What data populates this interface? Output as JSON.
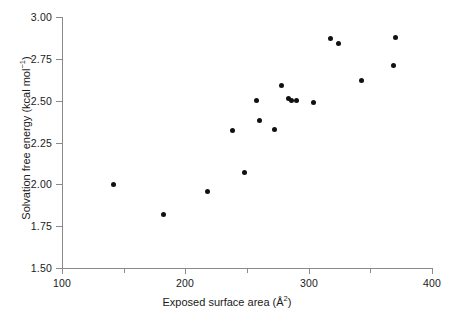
{
  "chart_data": {
    "type": "scatter",
    "title": "",
    "xlabel": "Exposed surface area (Å2)",
    "xlabel_base": "Exposed surface area (Å",
    "xlabel_sup": "2",
    "xlabel_tail": ")",
    "ylabel": "Solvation free energy (kcal mol-1)",
    "ylabel_base": "Solvation free energy (kcal mol",
    "ylabel_sup": "−1",
    "ylabel_tail": ")",
    "xlim": [
      100,
      400
    ],
    "ylim": [
      1.5,
      3.0
    ],
    "grid": false,
    "legend": null,
    "marker": "filled-circle",
    "marker_color": "#111111",
    "axis_color": "#8a8a8a",
    "xticks": [
      100,
      200,
      300,
      400
    ],
    "xticks_labels": [
      "100",
      "200",
      "300",
      "400"
    ],
    "xticks_minor": [
      150,
      250,
      350
    ],
    "yticks": [
      1.5,
      1.75,
      2.0,
      2.25,
      2.5,
      2.75,
      3.0
    ],
    "yticks_labels": [
      "1.50",
      "1.75",
      "2.00",
      "2.25",
      "2.50",
      "2.75",
      "3.00"
    ],
    "x": [
      142,
      182,
      218,
      238,
      248,
      258,
      260,
      272,
      278,
      284,
      288,
      290,
      304,
      318,
      324,
      343,
      369,
      370
    ],
    "y": [
      2.0,
      1.82,
      1.96,
      2.32,
      2.07,
      2.5,
      2.38,
      2.33,
      2.59,
      2.51,
      2.5,
      2.5,
      2.49,
      2.87,
      2.84,
      2.62,
      2.71,
      2.88
    ],
    "points": [
      {
        "x": 142,
        "y": 2.0
      },
      {
        "x": 182,
        "y": 1.82
      },
      {
        "x": 218,
        "y": 1.96
      },
      {
        "x": 238,
        "y": 2.32
      },
      {
        "x": 248,
        "y": 2.07
      },
      {
        "x": 258,
        "y": 2.5
      },
      {
        "x": 260,
        "y": 2.38
      },
      {
        "x": 272,
        "y": 2.33
      },
      {
        "x": 278,
        "y": 2.59
      },
      {
        "x": 284,
        "y": 2.51
      },
      {
        "x": 286,
        "y": 2.5
      },
      {
        "x": 290,
        "y": 2.5
      },
      {
        "x": 304,
        "y": 2.49
      },
      {
        "x": 318,
        "y": 2.87
      },
      {
        "x": 324,
        "y": 2.84
      },
      {
        "x": 343,
        "y": 2.62
      },
      {
        "x": 369,
        "y": 2.71
      },
      {
        "x": 370,
        "y": 2.88
      }
    ],
    "n_points": 18
  }
}
